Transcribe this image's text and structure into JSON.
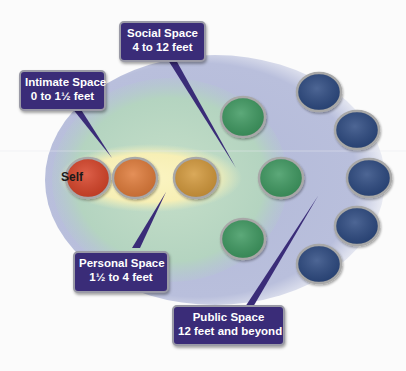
{
  "diagram": {
    "center_label": "Self",
    "zones": [
      {
        "name": "Intimate Space",
        "range": "0 to 1½ feet",
        "color": "#f6f0b4"
      },
      {
        "name": "Personal Space",
        "range": "1½ to 4 feet",
        "color": "#f6f0b4"
      },
      {
        "name": "Social Space",
        "range": "4 to 12 feet",
        "color": "#b9d8c4"
      },
      {
        "name": "Public Space",
        "range": "12 feet and beyond",
        "color": "#b7bddb"
      }
    ],
    "circles": {
      "self_color": "#d8442a",
      "intimate_color": "#e07c3a",
      "personal_color": "#d49a3c",
      "social_color": "#3f9a62",
      "public_color": "#2e4c82"
    }
  },
  "labels": {
    "intimate": {
      "line1": "Intimate Space",
      "line2": "0 to 1½ feet"
    },
    "social": {
      "line1": "Social Space",
      "line2": "4 to 12 feet"
    },
    "personal": {
      "line1": "Personal Space",
      "line2": "1½ to 4 feet"
    },
    "public": {
      "line1": "Public Space",
      "line2": "12 feet and beyond"
    }
  }
}
